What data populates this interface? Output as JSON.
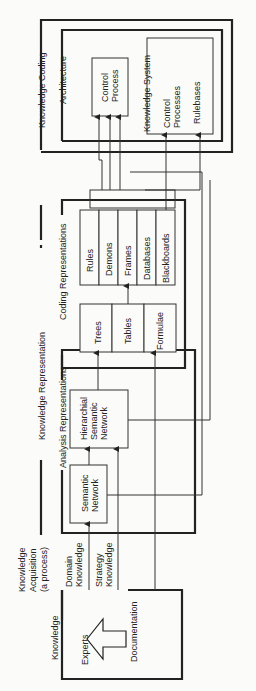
{
  "acquisition": {
    "label_lines": [
      "Knowledge",
      "Acquisition",
      "(a process)"
    ],
    "domain_lines": [
      "Domain",
      "Knowledge"
    ],
    "strategy_lines": [
      "Strategy",
      "Knowledge"
    ]
  },
  "knowledge_box": {
    "title": "Knowledge",
    "experts": "Experts",
    "documentation": "Documentation"
  },
  "representation": {
    "title": "Knowledge Representation"
  },
  "analysis": {
    "title": "Analysis Representations",
    "semantic": [
      "Semantic",
      "Network"
    ],
    "hierarchical": [
      "Hierarchial",
      "Semantic",
      "Network"
    ]
  },
  "coding": {
    "title": "Coding Representations",
    "left": [
      "Trees",
      "Tables",
      "Formulae"
    ],
    "right": [
      "Rules",
      "Demons",
      "Frames",
      "Databases",
      "Blackboards"
    ]
  },
  "knowledge_coding": {
    "title": "Knowledge Coding",
    "architecture": "Architecture",
    "control_process": [
      "Control",
      "Process"
    ],
    "knowledge_system": "Knowledge System",
    "control_processes": [
      "Control",
      "Processes"
    ],
    "rulebases": "Rulebases"
  },
  "arrow": {
    "icon": "left-arrow-icon"
  }
}
